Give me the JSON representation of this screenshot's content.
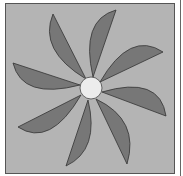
{
  "diagram": {
    "type": "pinwheel",
    "blade_count": 8,
    "colors": {
      "background": "#b4b4b4",
      "blade": "#777777",
      "outline": "#333333",
      "hub": "#ececec"
    },
    "hub": {
      "cx": 91,
      "cy": 88,
      "r": 11
    }
  }
}
